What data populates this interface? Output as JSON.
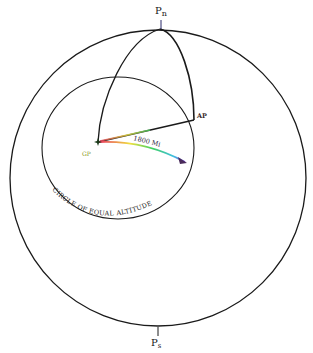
{
  "diagram": {
    "labels": {
      "north_pole": "P",
      "north_pole_sub": "n",
      "south_pole": "P",
      "south_pole_sub": "s",
      "assumed_position": "AP",
      "geographic_position": "GP",
      "distance": "1800 Mi",
      "circle_caption": "CIRCLE OF EQUAL ALTITUDE"
    },
    "colors": {
      "line": "#1a1a1a",
      "pole_mark": "#2a2a6a",
      "gp_label": "#8a9a2a",
      "arrow_gradient": [
        "#e83060",
        "#f0e040",
        "#40d060",
        "#40c0e0",
        "#8040e0"
      ]
    }
  }
}
